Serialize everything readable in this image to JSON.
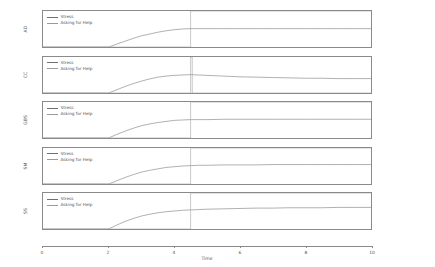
{
  "chart_data": {
    "type": "line",
    "title": "",
    "xlabel": "Time",
    "ylabel": "",
    "xlim": [
      0,
      10
    ],
    "ylim": [
      0,
      1
    ],
    "grid": false,
    "legend_position": "top-left",
    "xticks": [
      "0",
      "2",
      "4",
      "6",
      "8",
      "10"
    ],
    "xtick_values": [
      0,
      2,
      4,
      6,
      8,
      10
    ],
    "yticks": [
      "0.0",
      "0.5",
      "1.0"
    ],
    "ytick_values": [
      0.0,
      0.5,
      1.0
    ],
    "series_names": [
      "Stress",
      "Asking for Help"
    ],
    "colors": {
      "stress": "#6f6f6f",
      "asking_for_help": "#9a9a9a",
      "axis": "#8a8a8a",
      "text": "#555555",
      "background": "#ffffff"
    },
    "panels": [
      {
        "ylabel": "AD",
        "series": [
          {
            "name": "Stress",
            "x": [
              0,
              0.5,
              1.0,
              1.5,
              2.0,
              2.25,
              2.5,
              2.75,
              3.0,
              3.25,
              3.5,
              3.75,
              4.0,
              4.25,
              4.5,
              4.75,
              5.0,
              5.5,
              6.0,
              6.5,
              7.0,
              7.5,
              8.0,
              8.5,
              9.0,
              9.5,
              10.0
            ],
            "y": [
              0.0,
              0.0,
              0.0,
              0.0,
              0.0,
              0.08,
              0.16,
              0.24,
              0.31,
              0.36,
              0.41,
              0.45,
              0.48,
              0.5,
              0.51,
              0.51,
              0.51,
              0.51,
              0.51,
              0.51,
              0.51,
              0.51,
              0.51,
              0.51,
              0.51,
              0.51,
              0.51
            ]
          },
          {
            "name": "Asking for Help",
            "x": [
              0,
              4.5,
              4.5,
              10.0
            ],
            "y": [
              0.0,
              0.0,
              1.0,
              1.0
            ]
          }
        ]
      },
      {
        "ylabel": "CC",
        "series": [
          {
            "name": "Stress",
            "x": [
              0,
              0.5,
              1.0,
              1.5,
              2.0,
              2.25,
              2.5,
              2.75,
              3.0,
              3.25,
              3.5,
              3.75,
              4.0,
              4.25,
              4.5,
              4.75,
              5.0,
              5.5,
              6.0,
              6.5,
              7.0,
              7.5,
              8.0,
              8.5,
              9.0,
              9.5,
              10.0
            ],
            "y": [
              0.0,
              0.0,
              0.0,
              0.0,
              0.0,
              0.09,
              0.18,
              0.26,
              0.33,
              0.39,
              0.44,
              0.47,
              0.49,
              0.5,
              0.51,
              0.5,
              0.49,
              0.47,
              0.45,
              0.44,
              0.43,
              0.42,
              0.41,
              0.41,
              0.4,
              0.4,
              0.4
            ]
          },
          {
            "name": "Asking for Help",
            "x": [
              0,
              4.5,
              4.5,
              4.55,
              4.55,
              10.0
            ],
            "y": [
              0.0,
              0.0,
              1.0,
              1.0,
              0.0,
              0.0
            ]
          }
        ]
      },
      {
        "ylabel": "GBS",
        "series": [
          {
            "name": "Stress",
            "x": [
              0,
              0.5,
              1.0,
              1.5,
              2.0,
              2.25,
              2.5,
              2.75,
              3.0,
              3.25,
              3.5,
              3.75,
              4.0,
              4.25,
              4.5,
              4.75,
              5.0,
              5.5,
              6.0,
              6.5,
              7.0,
              7.5,
              8.0,
              8.5,
              9.0,
              9.5,
              10.0
            ],
            "y": [
              0.0,
              0.0,
              0.0,
              0.0,
              0.0,
              0.1,
              0.19,
              0.27,
              0.34,
              0.39,
              0.43,
              0.46,
              0.49,
              0.5,
              0.51,
              0.51,
              0.51,
              0.52,
              0.52,
              0.52,
              0.52,
              0.52,
              0.52,
              0.52,
              0.52,
              0.52,
              0.52
            ]
          },
          {
            "name": "Asking for Help",
            "x": [
              0,
              4.5,
              4.5,
              10.0
            ],
            "y": [
              0.0,
              0.0,
              1.0,
              1.0
            ]
          }
        ]
      },
      {
        "ylabel": "SM",
        "series": [
          {
            "name": "Stress",
            "x": [
              0,
              0.5,
              1.0,
              1.5,
              2.0,
              2.25,
              2.5,
              2.75,
              3.0,
              3.25,
              3.5,
              3.75,
              4.0,
              4.25,
              4.5,
              4.75,
              5.0,
              5.5,
              6.0,
              6.5,
              7.0,
              7.5,
              8.0,
              8.5,
              9.0,
              9.5,
              10.0
            ],
            "y": [
              0.0,
              0.0,
              0.0,
              0.0,
              0.0,
              0.09,
              0.18,
              0.26,
              0.33,
              0.38,
              0.42,
              0.46,
              0.48,
              0.5,
              0.51,
              0.52,
              0.52,
              0.53,
              0.53,
              0.53,
              0.54,
              0.54,
              0.54,
              0.54,
              0.54,
              0.54,
              0.54
            ]
          },
          {
            "name": "Asking for Help",
            "x": [
              0,
              4.5,
              4.5,
              10.0
            ],
            "y": [
              0.0,
              0.0,
              1.0,
              1.0
            ]
          }
        ]
      },
      {
        "ylabel": "SS",
        "series": [
          {
            "name": "Stress",
            "x": [
              0,
              0.5,
              1.0,
              1.5,
              2.0,
              2.25,
              2.5,
              2.75,
              3.0,
              3.25,
              3.5,
              3.75,
              4.0,
              4.25,
              4.5,
              4.75,
              5.0,
              5.5,
              6.0,
              6.5,
              7.0,
              7.5,
              8.0,
              8.5,
              9.0,
              9.5,
              10.0
            ],
            "y": [
              0.0,
              0.0,
              0.0,
              0.0,
              0.0,
              0.11,
              0.21,
              0.29,
              0.36,
              0.41,
              0.45,
              0.48,
              0.5,
              0.52,
              0.53,
              0.54,
              0.55,
              0.56,
              0.57,
              0.58,
              0.58,
              0.59,
              0.59,
              0.59,
              0.6,
              0.6,
              0.6
            ]
          },
          {
            "name": "Asking for Help",
            "x": [
              0,
              4.5,
              4.5,
              10.0
            ],
            "y": [
              0.0,
              0.0,
              1.0,
              1.0
            ]
          }
        ]
      }
    ]
  }
}
